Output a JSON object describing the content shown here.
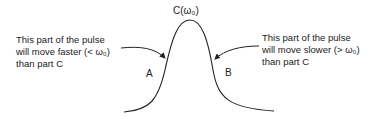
{
  "diagram": {
    "peak_label": "C(ω₀)",
    "point_a": "A",
    "point_b": "B",
    "left_annotation": {
      "line1": "This part of the pulse",
      "line2": "will move faster (<  ω₀)",
      "line3": "than part C"
    },
    "right_annotation": {
      "line1": "This part of the pulse",
      "line2": "will move slower (>  ω₀)",
      "line3": "than part C"
    },
    "colors": {
      "stroke": "#222222",
      "text": "#222222",
      "background": "#ffffff"
    }
  }
}
